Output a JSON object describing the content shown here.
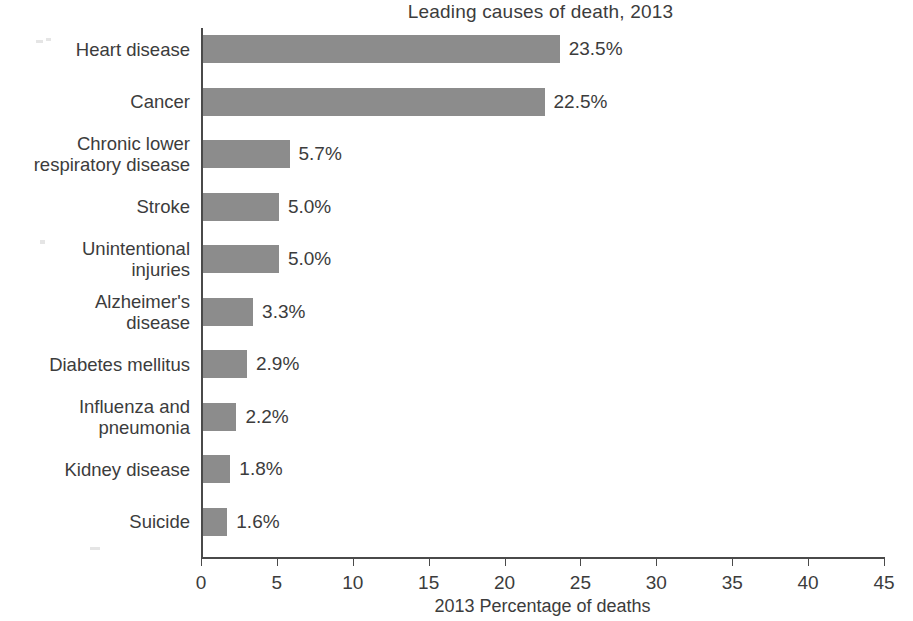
{
  "chart_data": {
    "type": "bar",
    "orientation": "horizontal",
    "title": "Leading causes of death, 2013",
    "xlabel": "2013 Percentage of deaths",
    "ylabel": "",
    "categories": [
      "Heart disease",
      "Cancer",
      "Chronic lower\nrespiratory disease",
      "Stroke",
      "Unintentional\ninjuries",
      "Alzheimer's\ndisease",
      "Diabetes mellitus",
      "Influenza and\npneumonia",
      "Kidney disease",
      "Suicide"
    ],
    "values": [
      23.5,
      22.5,
      5.7,
      5.0,
      5.0,
      3.3,
      2.9,
      2.2,
      1.8,
      1.6
    ],
    "value_labels": [
      "23.5%",
      "22.5%",
      "5.7%",
      "5.0%",
      "5.0%",
      "3.3%",
      "2.9%",
      "2.2%",
      "1.8%",
      "1.6%"
    ],
    "xlim": [
      0,
      45
    ],
    "xticks": [
      0,
      5,
      10,
      15,
      20,
      25,
      30,
      35,
      40,
      45
    ],
    "xtick_labels": [
      "0",
      "5",
      "10",
      "15",
      "20",
      "25",
      "30",
      "35",
      "40",
      "45"
    ],
    "grid": false,
    "legend": null,
    "bar_color": "#8c8c8c",
    "axis_color": "#4a4a4a",
    "text_color": "#3c3c3c",
    "background": "#ffffff"
  }
}
